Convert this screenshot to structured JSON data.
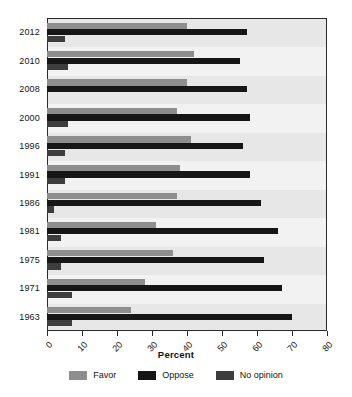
{
  "chart_data": {
    "type": "bar",
    "orientation": "horizontal",
    "title": "",
    "xlabel": "Percent",
    "ylabel": "",
    "xlim": [
      0,
      80
    ],
    "xticks": [
      0,
      10,
      20,
      30,
      40,
      50,
      60,
      70,
      80
    ],
    "xtick_labels": [
      "0",
      "10",
      "20",
      "30",
      "40",
      "50",
      "60",
      "70",
      "80"
    ],
    "grid": false,
    "legend_position": "bottom",
    "categories": [
      "2012",
      "2010",
      "2008",
      "2000",
      "1996",
      "1991",
      "1986",
      "1981",
      "1975",
      "1971",
      "1963"
    ],
    "series": [
      {
        "name": "Favor",
        "color": "#8e8e8e",
        "values": [
          40,
          42,
          40,
          37,
          41,
          38,
          37,
          31,
          36,
          28,
          24
        ]
      },
      {
        "name": "Oppose",
        "color": "#161616",
        "values": [
          57,
          55,
          57,
          58,
          56,
          58,
          61,
          66,
          62,
          67,
          70
        ]
      },
      {
        "name": "No opinion",
        "color": "#3d3d3d",
        "values": [
          5,
          6,
          0,
          6,
          5,
          5,
          2,
          4,
          4,
          7,
          7
        ]
      }
    ]
  },
  "legend": {
    "items": [
      {
        "label": "Favor",
        "color": "#8e8e8e"
      },
      {
        "label": "Oppose",
        "color": "#161616"
      },
      {
        "label": "No opinion",
        "color": "#3d3d3d"
      }
    ]
  },
  "colors": {
    "plot_background": "#efefef",
    "band_alt": "#f2f2f2",
    "frame": "#2b2b2b",
    "text": "#141414",
    "page_background": "#ffffff"
  }
}
